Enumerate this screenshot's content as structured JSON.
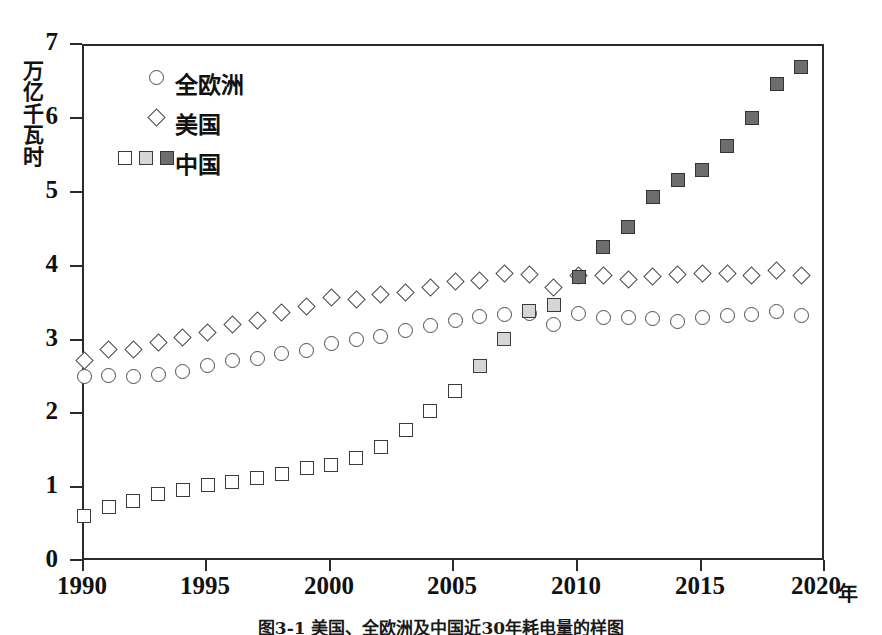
{
  "chart_data": {
    "type": "scatter",
    "title": "",
    "xlabel": "年",
    "ylabel": "万亿千瓦时",
    "xlim": [
      1990,
      2020
    ],
    "ylim": [
      0,
      7
    ],
    "xticks": [
      1990,
      1995,
      2000,
      2005,
      2010,
      2015,
      2020
    ],
    "yticks": [
      0,
      1,
      2,
      3,
      4,
      5,
      6,
      7
    ],
    "grid": false,
    "legend_position": "top-left",
    "x": [
      1990,
      1991,
      1992,
      1993,
      1994,
      1995,
      1996,
      1997,
      1998,
      1999,
      2000,
      2001,
      2002,
      2003,
      2004,
      2005,
      2006,
      2007,
      2008,
      2009,
      2010,
      2011,
      2012,
      2013,
      2014,
      2015,
      2016,
      2017,
      2018,
      2019
    ],
    "series": [
      {
        "name": "全欧洲",
        "marker": "circle",
        "marker_fill": "#ffffff",
        "marker_edge": "#4a4a52",
        "values": [
          2.52,
          2.53,
          2.52,
          2.55,
          2.59,
          2.66,
          2.73,
          2.76,
          2.83,
          2.87,
          2.96,
          3.02,
          3.06,
          3.14,
          3.21,
          3.27,
          3.33,
          3.36,
          3.37,
          3.22,
          3.37,
          3.32,
          3.32,
          3.31,
          3.26,
          3.32,
          3.34,
          3.36,
          3.4,
          3.35
        ]
      },
      {
        "name": "美国",
        "marker": "diamond",
        "marker_fill": "#ffffff",
        "marker_edge": "#4a4a52",
        "values": [
          2.74,
          2.88,
          2.88,
          2.98,
          3.04,
          3.12,
          3.22,
          3.27,
          3.39,
          3.46,
          3.59,
          3.56,
          3.63,
          3.66,
          3.72,
          3.81,
          3.82,
          3.92,
          3.9,
          3.72,
          3.89,
          3.88,
          3.83,
          3.87,
          3.9,
          3.91,
          3.91,
          3.88,
          3.95,
          3.88
        ]
      },
      {
        "name": "中国",
        "marker": "square",
        "marker_fill_sequence": [
          "#ffffff",
          "#d6d6d6",
          "#6d6d6d"
        ],
        "marker_edge": "#3a3a3a",
        "values": [
          0.62,
          0.75,
          0.83,
          0.92,
          0.97,
          1.04,
          1.09,
          1.14,
          1.2,
          1.27,
          1.32,
          1.41,
          1.56,
          1.79,
          2.05,
          2.32,
          2.66,
          3.03,
          3.41,
          3.48,
          3.86,
          4.28,
          4.54,
          4.95,
          5.18,
          5.32,
          5.64,
          6.02,
          6.48,
          6.72
        ],
        "shading": [
          {
            "years": [
              1990,
              2005
            ],
            "shade": "white"
          },
          {
            "years": [
              2006,
              2009
            ],
            "shade": "light"
          },
          {
            "years": [
              2010,
              2019
            ],
            "shade": "dark"
          }
        ]
      }
    ]
  },
  "legend": {
    "items": [
      {
        "label": "全欧洲",
        "marker": "circle"
      },
      {
        "label": "美国",
        "marker": "diamond"
      },
      {
        "label": "中国",
        "marker": "square-triple"
      }
    ]
  },
  "axes": {
    "y_unit_chars": [
      "万",
      "亿",
      "千",
      "瓦",
      "时"
    ],
    "y_tick_labels": [
      "7",
      "6",
      "5",
      "4",
      "3",
      "2",
      "1",
      "0"
    ],
    "x_tick_labels": [
      "1990",
      "1995",
      "2000",
      "2005",
      "2010",
      "2015",
      "2020"
    ],
    "x_unit": "年"
  },
  "caption": {
    "text": "图3-1 美国、全欧洲及中国近30年耗电量的样图"
  },
  "colors": {
    "axis": "#2b2b2b",
    "marker_edge": "#4a4a52",
    "square_white": "#ffffff",
    "square_light": "#d6d6d6",
    "square_dark": "#6d6d6d"
  }
}
